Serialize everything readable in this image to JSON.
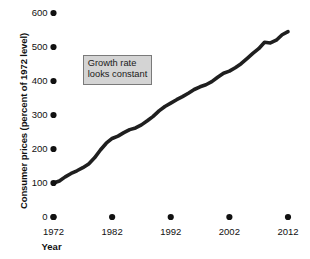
{
  "chart_data": {
    "type": "line",
    "title": "",
    "xlabel": "Year",
    "ylabel": "Consumer prices (percent of 1972 level)",
    "xlim": [
      1972,
      2012
    ],
    "ylim": [
      0,
      600
    ],
    "grid": false,
    "legend": "none",
    "line_color": "#1f1f1f",
    "xticks": [
      1972,
      1982,
      1992,
      2002,
      2012
    ],
    "xtick_labels": [
      "1972",
      "1982",
      "1992",
      "2002",
      "2012"
    ],
    "yticks": [
      0,
      100,
      200,
      300,
      400,
      500,
      600
    ],
    "ytick_labels": [
      "0",
      "100",
      "200",
      "300",
      "400",
      "500",
      "600"
    ],
    "tick_marker": "filled-circle",
    "x": [
      1972,
      1973,
      1974,
      1975,
      1976,
      1977,
      1978,
      1979,
      1980,
      1981,
      1982,
      1983,
      1984,
      1985,
      1986,
      1987,
      1988,
      1989,
      1990,
      1991,
      1992,
      1993,
      1994,
      1995,
      1996,
      1997,
      1998,
      1999,
      2000,
      2001,
      2002,
      2003,
      2004,
      2005,
      2006,
      2007,
      2008,
      2009,
      2010,
      2011,
      2012
    ],
    "values": [
      100,
      106,
      118,
      128,
      136,
      145,
      156,
      174,
      197,
      217,
      231,
      238,
      248,
      257,
      262,
      271,
      283,
      296,
      312,
      325,
      335,
      345,
      354,
      364,
      375,
      383,
      389,
      398,
      411,
      423,
      429,
      439,
      451,
      466,
      481,
      495,
      514,
      512,
      520,
      536,
      545
    ],
    "annotations": [
      {
        "name": "growth-rate-callout",
        "lines": [
          "Growth rate",
          "looks constant"
        ],
        "x": 1977.0,
        "y": 478,
        "background": "#d4d4d4",
        "border": "#7a7a7a"
      }
    ]
  },
  "axes": {
    "y_title": "Consumer prices (percent of 1972 level)",
    "x_title": "Year"
  }
}
